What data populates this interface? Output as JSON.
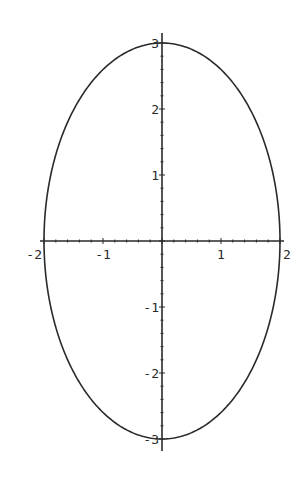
{
  "chart_data": {
    "type": "line",
    "title": "",
    "xlabel": "",
    "ylabel": "",
    "series": [
      {
        "name": "ellipse",
        "semi_axis_x": 2,
        "semi_axis_y": 3,
        "center": [
          0,
          0
        ]
      }
    ],
    "xlim": [
      -2,
      2
    ],
    "ylim": [
      -3,
      3
    ],
    "x_ticks": [
      -2,
      -1,
      1,
      2
    ],
    "y_ticks": [
      -3,
      -2,
      -1,
      1,
      2,
      3
    ],
    "x_tick_labels": [
      "-2",
      "-1",
      "1",
      "2"
    ],
    "y_tick_labels": [
      "-3",
      "-2",
      "-1",
      "1",
      "2",
      "3"
    ],
    "grid": false,
    "legend": null,
    "axes_origin": [
      0,
      0
    ],
    "line_color": "#2a2a2a"
  }
}
